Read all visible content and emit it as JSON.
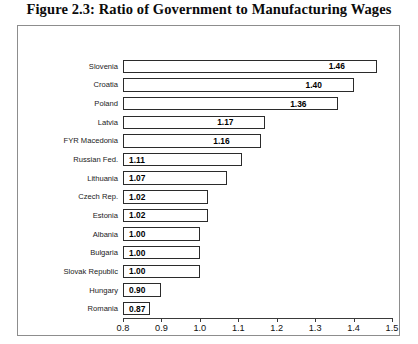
{
  "figure": {
    "title": "Figure 2.3:  Ratio of Government to Manufacturing Wages"
  },
  "chart_data": {
    "type": "bar",
    "orientation": "horizontal",
    "title": "Figure 2.3:  Ratio of Government to Manufacturing Wages",
    "xlabel": "",
    "ylabel": "",
    "xlim": [
      0.8,
      1.5
    ],
    "grid": false,
    "legend": null,
    "bar_style": {
      "fill": "#ffffff",
      "border": "#2b2b2b"
    },
    "xticks": [
      "0.8",
      "0.9",
      "1.0",
      "1.1",
      "1.2",
      "1.3",
      "1.4",
      "1.5"
    ],
    "xtick_values": [
      0.8,
      0.9,
      1.0,
      1.1,
      1.2,
      1.3,
      1.4,
      1.5
    ],
    "categories": [
      "Slovenia",
      "Croatia",
      "Poland",
      "Latvia",
      "FYR Macedonia",
      "Russian Fed.",
      "Lithuania",
      "Czech Rep.",
      "Estonia",
      "Albania",
      "Bulgaria",
      "Slovak Republic",
      "Hungary",
      "Romania"
    ],
    "values": [
      1.46,
      1.4,
      1.36,
      1.17,
      1.16,
      1.11,
      1.07,
      1.02,
      1.02,
      1.0,
      1.0,
      1.0,
      0.9,
      0.87
    ],
    "value_labels": [
      "1.46",
      "1.40",
      "1.36",
      "1.17",
      "1.16",
      "1.11",
      "1.07",
      "1.02",
      "1.02",
      "1.00",
      "1.00",
      "1.00",
      "0.90",
      "0.87"
    ]
  }
}
